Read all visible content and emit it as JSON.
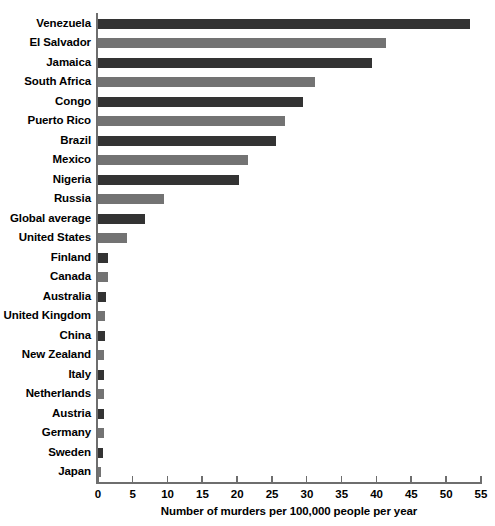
{
  "chart_data": {
    "type": "bar",
    "orientation": "horizontal",
    "title": "",
    "subtitle": "",
    "xlabel": "Number of murders per 100,000 people per year",
    "ylabel": "",
    "xlim": [
      0,
      55
    ],
    "xticks": [
      0,
      5,
      10,
      15,
      20,
      25,
      30,
      35,
      40,
      45,
      50,
      55
    ],
    "xtick_labels": [
      "0",
      "5",
      "10",
      "15",
      "20",
      "25",
      "30",
      "35",
      "40",
      "45",
      "50",
      "55"
    ],
    "grid": false,
    "legend": null,
    "legend_position": "none",
    "categories": [
      "Venezuela",
      "El Salvador",
      "Jamaica",
      "South Africa",
      "Congo",
      "Puerto Rico",
      "Brazil",
      "Mexico",
      "Nigeria",
      "Russia",
      "Global average",
      "United States",
      "Finland",
      "Canada",
      "Australia",
      "United Kingdom",
      "China",
      "New Zealand",
      "Italy",
      "Netherlands",
      "Austria",
      "Germany",
      "Sweden",
      "Japan"
    ],
    "values": [
      53.4,
      41.4,
      39.3,
      31.1,
      29.5,
      26.9,
      25.5,
      21.5,
      20.3,
      9.5,
      6.8,
      4.2,
      1.45,
      1.45,
      1.1,
      1.0,
      1.0,
      0.9,
      0.8,
      0.8,
      0.8,
      0.8,
      0.7,
      0.4
    ],
    "colors": {
      "bar_dark": "#333333",
      "bar_light": "#737373",
      "axis": "#6e6e6e",
      "text": "#000000",
      "background": "#ffffff"
    },
    "bar_color_pattern": "alternating dark/light starting with dark"
  }
}
